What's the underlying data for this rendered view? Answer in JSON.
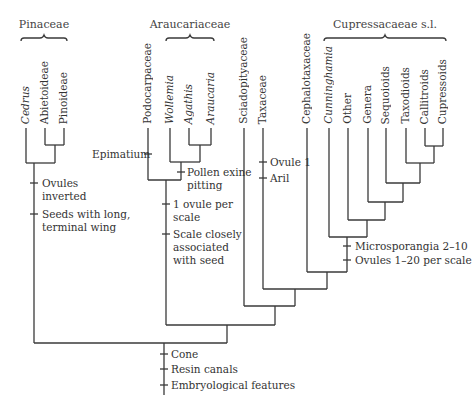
{
  "groups": {
    "pinaceae": "Pinaceae",
    "araucariaceae": "Araucariaceae",
    "cupressaceae": "Cupressacaeae s.l."
  },
  "taxa": [
    {
      "id": "cedrus",
      "label": "Cedrus",
      "italic": true
    },
    {
      "id": "abietoideae",
      "label": "Abietoideae",
      "italic": false
    },
    {
      "id": "pinoideae",
      "label": "Pinoideae",
      "italic": false
    },
    {
      "id": "podocarpaceae",
      "label": "Podocarpaceae",
      "italic": false
    },
    {
      "id": "wollemia",
      "label": "Wollemia",
      "italic": true
    },
    {
      "id": "agathis",
      "label": "Agathis",
      "italic": true
    },
    {
      "id": "araucaria",
      "label": "Araucaria",
      "italic": true
    },
    {
      "id": "sciadopityaceae",
      "label": "Sciadopityaceae",
      "italic": false
    },
    {
      "id": "taxaceae",
      "label": "Taxaceae",
      "italic": false
    },
    {
      "id": "cephalotaxaceae",
      "label": "Cephalotaxaceae",
      "italic": false
    },
    {
      "id": "cunninghamia",
      "label": "Cunninghamia",
      "italic": true
    },
    {
      "id": "other",
      "label": "Other",
      "italic": false
    },
    {
      "id": "genera",
      "label": "Genera",
      "italic": false
    },
    {
      "id": "sequoioids",
      "label": "Sequoioids",
      "italic": false
    },
    {
      "id": "taxodioids",
      "label": "Taxodioids",
      "italic": false
    },
    {
      "id": "callitroids",
      "label": "Callitroids",
      "italic": false
    },
    {
      "id": "cupressoids",
      "label": "Cupressoids",
      "italic": false
    }
  ],
  "characters": {
    "ovules_inverted": "Ovules\ninverted",
    "seeds_wing": "Seeds with long,\nterminal wing",
    "epimatium": "Epimatium",
    "pollen_exine": "Pollen exine\npitting",
    "one_ovule": "1 ovule per\nscale",
    "scale_associated": "Scale closely\nassociated\nwith seed",
    "ovule1": "Ovule 1",
    "aril": "Aril",
    "microsporangia": "Microsporangia 2–10",
    "ovules_1_20": "Ovules 1–20 per scale",
    "cone": "Cone",
    "resin_canals": "Resin canals",
    "embryological": "Embryological features"
  },
  "colors": {
    "line": "#3a3a3a",
    "text": "#333333"
  }
}
